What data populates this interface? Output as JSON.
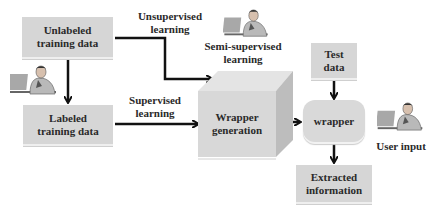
{
  "diagram": {
    "nodes": {
      "unlabeled": {
        "line1": "Unlabeled",
        "line2": "training data"
      },
      "labeled": {
        "line1": "Labeled",
        "line2": "training data"
      },
      "wrapper_generation": {
        "line1": "Wrapper",
        "line2": "generation"
      },
      "test_data": {
        "line1": "Test",
        "line2": "data"
      },
      "wrapper": {
        "label": "wrapper"
      },
      "extracted": {
        "line1": "Extracted",
        "line2": "information"
      }
    },
    "edge_labels": {
      "unsupervised": {
        "line1": "Unsupervised",
        "line2": "learning"
      },
      "supervised": {
        "line1": "Supervised",
        "line2": "learning"
      },
      "semi_supervised": {
        "line1": "Semi-supervised",
        "line2": "learning"
      },
      "user_input": "User input"
    },
    "edges": [
      {
        "from": "unlabeled",
        "to": "labeled"
      },
      {
        "from": "unlabeled",
        "to": "wrapper_generation",
        "label": "Unsupervised learning"
      },
      {
        "from": "labeled",
        "to": "wrapper_generation",
        "label": "Supervised learning"
      },
      {
        "from": "wrapper_generation",
        "to": "wrapper"
      },
      {
        "from": "test_data",
        "to": "wrapper"
      },
      {
        "from": "wrapper",
        "to": "extracted"
      }
    ],
    "icons": [
      "person-at-laptop-icon",
      "person-at-laptop-icon",
      "person-at-laptop-icon"
    ],
    "colors": {
      "box": "#d6d6d6",
      "arrow": "#111111",
      "text": "#2a2a2a"
    }
  }
}
